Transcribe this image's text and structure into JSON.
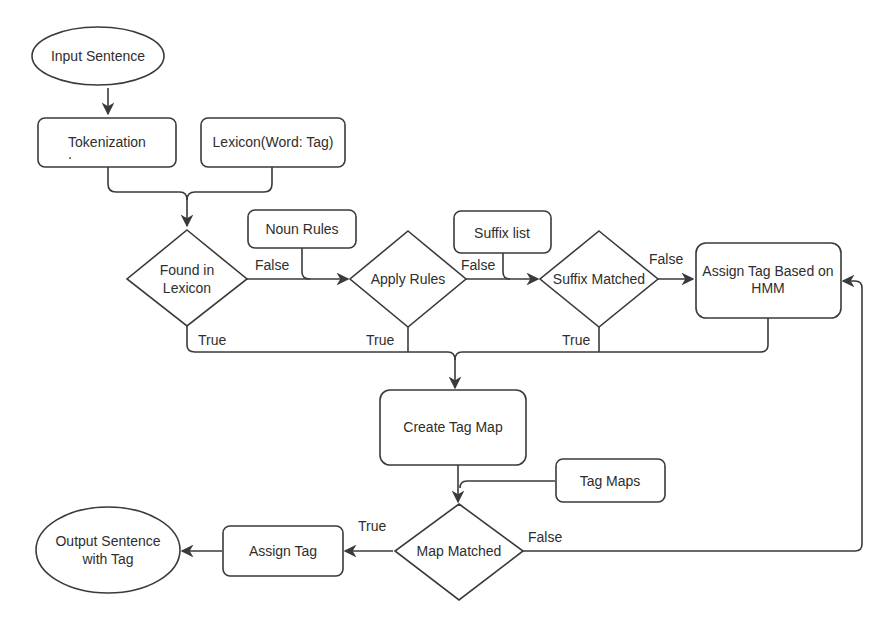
{
  "diagram": {
    "nodes": {
      "input_sentence": {
        "label": "Input Sentence",
        "shape": "ellipse"
      },
      "tokenization": {
        "label": "Tokenization",
        "shape": "rounded-rect"
      },
      "lexicon": {
        "label": "Lexicon(Word: Tag)",
        "shape": "rounded-rect"
      },
      "found_in_lexicon": {
        "line1": "Found in",
        "line2": "Lexicon",
        "shape": "diamond"
      },
      "noun_rules": {
        "label": "Noun Rules",
        "shape": "rounded-rect"
      },
      "apply_rules": {
        "label": "Apply Rules",
        "shape": "diamond"
      },
      "suffix_list": {
        "label": "Suffix list",
        "shape": "rounded-rect"
      },
      "suffix_matched": {
        "label": "Suffix Matched",
        "shape": "diamond"
      },
      "assign_hmm": {
        "line1": "Assign Tag Based on",
        "line2": "HMM",
        "shape": "rounded-rect"
      },
      "create_tag_map": {
        "label": "Create Tag Map",
        "shape": "rounded-rect"
      },
      "tag_maps": {
        "label": "Tag Maps",
        "shape": "rounded-rect"
      },
      "map_matched": {
        "label": "Map Matched",
        "shape": "diamond"
      },
      "assign_tag": {
        "label": "Assign Tag",
        "shape": "rounded-rect"
      },
      "output_sentence": {
        "line1": "Output Sentence",
        "line2": "with Tag",
        "shape": "ellipse"
      }
    },
    "edge_labels": {
      "found_false": "False",
      "found_true": "True",
      "apply_false": "False",
      "apply_true": "True",
      "suffix_false": "False",
      "suffix_true": "True",
      "map_true": "True",
      "map_false": "False"
    },
    "colors": {
      "stroke": "#3a3a3a",
      "fill": "#ffffff",
      "text": "#2e2e2e"
    }
  }
}
